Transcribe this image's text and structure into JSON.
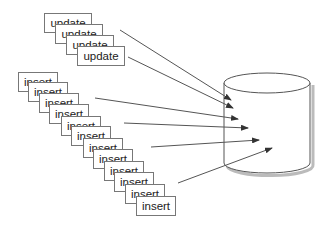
{
  "diagram": {
    "update_cards": [
      {
        "label": "update",
        "x": 44,
        "y": 13
      },
      {
        "label": "update",
        "x": 55,
        "y": 24
      },
      {
        "label": "update",
        "x": 66,
        "y": 35
      },
      {
        "label": "update",
        "x": 77,
        "y": 46
      }
    ],
    "insert_cards": [
      {
        "label": "insert",
        "x": 18,
        "y": 72
      },
      {
        "label": "insert",
        "x": 28,
        "y": 82
      },
      {
        "label": "insert",
        "x": 39,
        "y": 93
      },
      {
        "label": "insert",
        "x": 49,
        "y": 104
      },
      {
        "label": "insert",
        "x": 61,
        "y": 116
      },
      {
        "label": "insert",
        "x": 71,
        "y": 126
      },
      {
        "label": "insert",
        "x": 83,
        "y": 138
      },
      {
        "label": "insert",
        "x": 93,
        "y": 149
      },
      {
        "label": "insert",
        "x": 104,
        "y": 161
      },
      {
        "label": "insert",
        "x": 114,
        "y": 172
      },
      {
        "label": "insert",
        "x": 125,
        "y": 184
      },
      {
        "label": "insert",
        "x": 136,
        "y": 196
      }
    ],
    "arrows": [
      {
        "x1": 120,
        "y1": 30,
        "x2": 231,
        "y2": 100
      },
      {
        "x1": 128,
        "y1": 57,
        "x2": 233,
        "y2": 108
      },
      {
        "x1": 95,
        "y1": 98,
        "x2": 238,
        "y2": 119
      },
      {
        "x1": 124,
        "y1": 123,
        "x2": 248,
        "y2": 128
      },
      {
        "x1": 151,
        "y1": 147,
        "x2": 259,
        "y2": 140
      },
      {
        "x1": 178,
        "y1": 183,
        "x2": 272,
        "y2": 148
      }
    ],
    "database": {
      "cx": 267,
      "top_cy": 83,
      "bottom_cy": 163,
      "rx": 43,
      "ry": 10
    },
    "colors": {
      "stroke": "#555555",
      "card_border": "#777777",
      "shadow": "#bbbbbb",
      "text": "#222222"
    }
  }
}
